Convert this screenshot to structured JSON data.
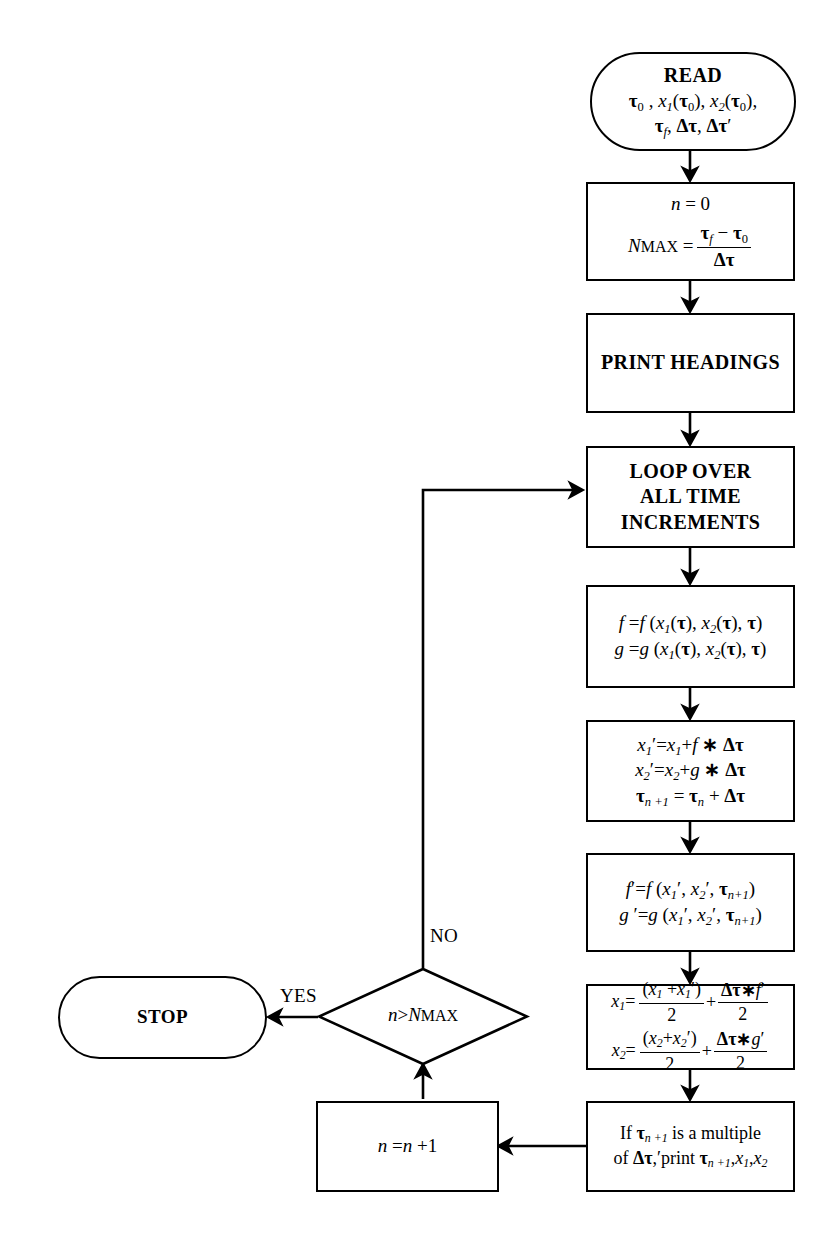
{
  "diagram": {
    "type": "flowchart",
    "nodes": {
      "read": {
        "shape": "terminator",
        "line1": "READ",
        "line2": "τ0 , x1(τ0), x2(τ0),",
        "line3": "τf , Δτ, Δτ′"
      },
      "init": {
        "shape": "process",
        "line1": "n = 0",
        "line2": "NMAX = (τf − τ0) / Δτ"
      },
      "print_headings": {
        "shape": "process",
        "label": "PRINT HEADINGS"
      },
      "loop": {
        "shape": "process",
        "line1": "LOOP OVER",
        "line2": "ALL  TIME",
        "line3": "INCREMENTS"
      },
      "derivs": {
        "shape": "process",
        "line1": "f = f (x1(τ), x2(τ), τ)",
        "line2": "g = g (x1(τ), x2(τ), τ)"
      },
      "predictor": {
        "shape": "process",
        "line1": "x1′ = x1 + f ∗ Δτ",
        "line2": "x2′ = x2 + g ∗ Δτ",
        "line3": "τn+1 = τn + Δτ"
      },
      "derivs_prime": {
        "shape": "process",
        "line1": "f ′ = f (x1′ , x2′ , τn+1)",
        "line2": "g ′ = g (x1′ , x2′ , τn+1)"
      },
      "corrector": {
        "shape": "process",
        "line1": "x1 = (x1 + x1′)/2 + Δτ ∗ f ′/2",
        "line2": "x2 = (x2 + x2′)/2 + Δτ ∗ g ′/2"
      },
      "print_cond": {
        "shape": "process",
        "line1": "If τn+1 is a multiple",
        "line2": "of Δτ,′ print τn+1, x1, x2"
      },
      "increment": {
        "shape": "process",
        "label": "n = n + 1"
      },
      "decision": {
        "shape": "diamond",
        "label": "n > NMAX"
      },
      "stop": {
        "shape": "terminator",
        "label": "STOP"
      }
    },
    "edge_labels": {
      "no": "NO",
      "yes": "YES"
    },
    "colors": {
      "stroke": "#000000",
      "fill": "#ffffff"
    }
  }
}
